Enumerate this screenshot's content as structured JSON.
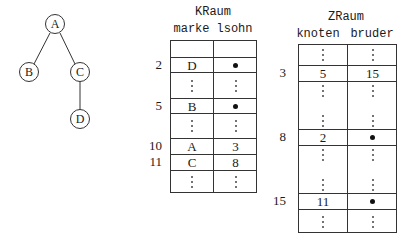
{
  "tree": {
    "nodes": [
      {
        "id": "A",
        "label": "A",
        "cx": 55,
        "cy": 25
      },
      {
        "id": "B",
        "label": "B",
        "cx": 29,
        "cy": 72
      },
      {
        "id": "C",
        "label": "C",
        "cx": 80,
        "cy": 72
      },
      {
        "id": "D",
        "label": "D",
        "cx": 80,
        "cy": 119
      }
    ],
    "edges": [
      [
        "A",
        "B"
      ],
      [
        "A",
        "C"
      ],
      [
        "C",
        "D"
      ]
    ]
  },
  "kraum": {
    "title": "KRaum",
    "columns": [
      "marke",
      "lsohn"
    ],
    "rows": [
      {
        "index": "",
        "marke": "",
        "lsohn": "",
        "type": "blank"
      },
      {
        "index": "2",
        "marke": "D",
        "lsohn": "•",
        "type": "data"
      },
      {
        "index": "",
        "marke": "⋮",
        "lsohn": "⋮",
        "type": "dots"
      },
      {
        "index": "5",
        "marke": "B",
        "lsohn": "•",
        "type": "data"
      },
      {
        "index": "",
        "marke": "⋮",
        "lsohn": "⋮",
        "type": "dots"
      },
      {
        "index": "10",
        "marke": "A",
        "lsohn": "3",
        "type": "data"
      },
      {
        "index": "11",
        "marke": "C",
        "lsohn": "8",
        "type": "data"
      },
      {
        "index": "",
        "marke": "⋮",
        "lsohn": "⋮",
        "type": "dots"
      }
    ]
  },
  "zraum": {
    "title": "ZRaum",
    "columns": [
      "knoten",
      "bruder"
    ],
    "rows": [
      {
        "index": "",
        "knoten": "⋮",
        "bruder": "⋮",
        "type": "dots"
      },
      {
        "index": "3",
        "knoten": "5",
        "bruder": "15",
        "type": "data"
      },
      {
        "index": "",
        "knoten": "⋮",
        "bruder": "⋮",
        "type": "dots"
      },
      {
        "index": "8",
        "knoten": "2",
        "bruder": "•",
        "type": "data"
      },
      {
        "index": "",
        "knoten": "⋮",
        "bruder": "⋮",
        "type": "dots"
      },
      {
        "index": "15",
        "knoten": "11",
        "bruder": "•",
        "type": "data"
      },
      {
        "index": "",
        "knoten": "⋮",
        "bruder": "⋮",
        "type": "dots"
      }
    ]
  }
}
